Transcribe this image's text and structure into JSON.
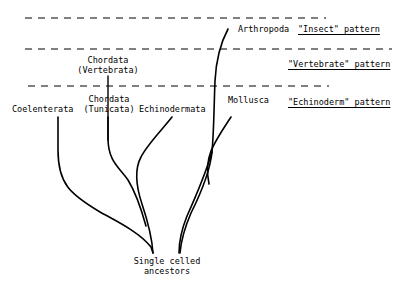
{
  "diagram": {
    "background_color": "#ffffff",
    "ink_color": "#000000"
  },
  "taxa": [
    {
      "id": "coelenterata",
      "label": "Coelenterata",
      "x": 12,
      "y": 105
    },
    {
      "id": "chordata-vertebrata",
      "label": "Chordata\n(Vertebrata)",
      "x": 76,
      "y": 57
    },
    {
      "id": "chordata-tunicata",
      "label": "Chordata\n(Tunicata)",
      "x": 82,
      "y": 96
    },
    {
      "id": "echinodermata",
      "label": "Echinodermata",
      "x": 139,
      "y": 105
    },
    {
      "id": "mollusca",
      "label": "Mollusca",
      "x": 228,
      "y": 96
    },
    {
      "id": "arthropoda",
      "label": "Arthropoda",
      "x": 238,
      "y": 25
    }
  ],
  "patterns": [
    {
      "id": "insect",
      "label": "\"Insect\" pattern",
      "x": 298,
      "y": 25
    },
    {
      "id": "vertebrate",
      "label": "\"Vertebrate\" pattern",
      "x": 288,
      "y": 60
    },
    {
      "id": "echinoderm",
      "label": "\"Echinoderm\" pattern",
      "x": 288,
      "y": 98
    }
  ],
  "root": {
    "label": "Single celled\nancestors",
    "x": 120,
    "y": 258
  },
  "divider_lines": [
    {
      "id": "divider-top",
      "y": 18,
      "x1": 25,
      "x2": 326
    },
    {
      "id": "divider-middle",
      "y": 49,
      "x1": 25,
      "x2": 392
    },
    {
      "id": "divider-bottom",
      "y": 86,
      "x1": 28,
      "x2": 329
    }
  ],
  "branches": [
    {
      "id": "branch-coelenterata",
      "path": "M 58 117 L 58 152 C 58 186 72 196 104 214 C 122 224 140 232 152 246 L 154 253"
    },
    {
      "id": "branch-chordata-vertebrata",
      "path": "M 108 76 L 108 146"
    },
    {
      "id": "branch-chordata-tunicata",
      "path": "M 108 117 L 108 140 C 108 166 120 170 128 182 C 136 194 140 206 145 224"
    },
    {
      "id": "branch-echinodermata",
      "path": "M 170 117 C 160 132 146 146 140 158 C 134 170 136 186 142 204 C 148 222 152 238 153 253"
    },
    {
      "id": "branch-mollusca",
      "path": "M 230 117 C 222 129 214 141 210 152 C 206 163 206 176 208 186"
    },
    {
      "id": "branch-arthropoda",
      "path": "M 228 29 C 220 44 216 60 215 80 C 214 104 214 128 212 152 C 210 170 202 192 192 212 C 186 226 182 240 181 253"
    },
    {
      "id": "branch-arthropoda-lower",
      "path": "M 212 152 C 206 170 196 196 186 216 C 180 230 178 242 178 253"
    }
  ],
  "stroke_widths": {
    "branch": 1.6,
    "divider": 1.0,
    "vertical_tick": 1.2
  }
}
